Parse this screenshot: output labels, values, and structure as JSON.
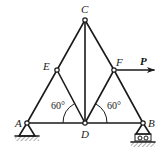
{
  "diagram": {
    "type": "truss",
    "nodes": {
      "A": {
        "label": "A",
        "x": 27,
        "y": 123,
        "support": "pin"
      },
      "B": {
        "label": "B",
        "x": 143,
        "y": 123,
        "support": "roller"
      },
      "C": {
        "label": "C",
        "x": 85,
        "y": 20
      },
      "D": {
        "label": "D",
        "x": 85,
        "y": 123
      },
      "E": {
        "label": "E",
        "x": 57,
        "y": 70
      },
      "F": {
        "label": "F",
        "x": 114,
        "y": 70
      }
    },
    "members": [
      "AE",
      "EC",
      "CF",
      "FB",
      "CD",
      "ED",
      "DF",
      "AD",
      "DB"
    ],
    "load": {
      "label": "P",
      "at": "F",
      "direction": "right"
    },
    "angles": [
      {
        "label": "60°",
        "at": "D",
        "between": [
          "DA",
          "DE"
        ]
      },
      {
        "label": "60°",
        "at": "D",
        "between": [
          "DB",
          "DF"
        ]
      }
    ],
    "colors": {
      "line": "#1a1a1a",
      "background": "#ffffff"
    }
  }
}
